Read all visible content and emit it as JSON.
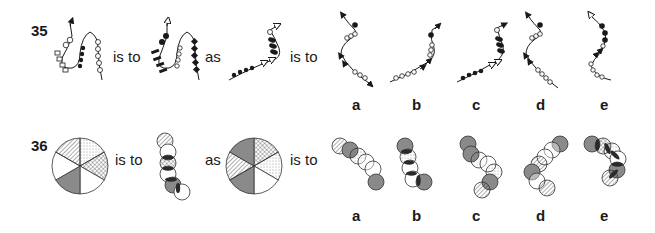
{
  "questions": [
    {
      "number": "35",
      "connector_1": "is to",
      "connector_2": "as",
      "connector_3": "is to",
      "figures": [
        "wavy-chain-A",
        "wavy-chain-B",
        "wavy-chain-C"
      ],
      "options": [
        {
          "label": "a"
        },
        {
          "label": "b"
        },
        {
          "label": "c"
        },
        {
          "label": "d"
        },
        {
          "label": "e"
        }
      ]
    },
    {
      "number": "36",
      "connector_1": "is to",
      "connector_2": "as",
      "connector_3": "is to",
      "figures": [
        "six-sector-circle-A",
        "overlapping-circle-chain-B",
        "six-sector-circle-C"
      ],
      "options": [
        {
          "label": "a"
        },
        {
          "label": "b"
        },
        {
          "label": "c"
        },
        {
          "label": "d"
        },
        {
          "label": "e"
        }
      ]
    }
  ],
  "colors": {
    "ink": "#1a1a1a",
    "grey_fill": "#8a8a8a",
    "dark_fill": "#2a2a2a",
    "background": "#ffffff"
  }
}
